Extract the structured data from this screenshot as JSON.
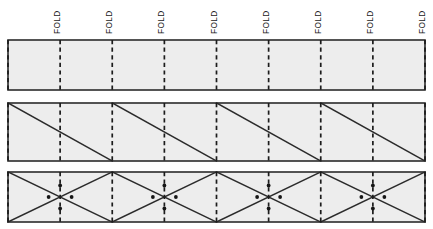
{
  "figure": {
    "canvas": {
      "width": 433,
      "height": 229
    },
    "background_color": "#ffffff",
    "panel_fill_color": "#ededed",
    "line_color": "#2b2b2b",
    "fold_line_color": "#1c1c1c",
    "dot_color": "#161616"
  },
  "fold_labels": [
    {
      "text": "FOLD"
    },
    {
      "text": "FOLD"
    },
    {
      "text": "FOLD"
    },
    {
      "text": "FOLD"
    },
    {
      "text": "FOLD"
    },
    {
      "text": "FOLD"
    },
    {
      "text": "FOLD"
    },
    {
      "text": "FOLD"
    }
  ],
  "geometry": {
    "left": 8,
    "right": 425,
    "cell_count": 8,
    "cell_width": 52.125,
    "fold_positions": [
      8,
      60.125,
      112.25,
      164.375,
      216.5,
      268.625,
      320.75,
      372.875,
      425
    ],
    "label_positions": [
      60.125,
      112.25,
      164.375,
      216.5,
      268.625,
      320.75,
      372.875,
      425
    ],
    "label_baseline_y": 34
  },
  "panels": [
    {
      "name": "plain-strip",
      "label": "Panel 1 - plain strip with fold lines",
      "top": 40,
      "bottom": 90,
      "pattern": "none",
      "has_dots": false
    },
    {
      "name": "sawtooth-strip",
      "label": "Panel 2 - sawtooth diagonals",
      "top": 103,
      "bottom": 161,
      "pattern": "sawtooth",
      "has_dots": false,
      "diagonals": [
        {
          "x1": 8,
          "y1": 103,
          "x2": 112.25,
          "y2": 161
        },
        {
          "x1": 112.25,
          "y1": 103,
          "x2": 216.5,
          "y2": 161
        },
        {
          "x1": 216.5,
          "y1": 103,
          "x2": 320.75,
          "y2": 161
        },
        {
          "x1": 320.75,
          "y1": 103,
          "x2": 425,
          "y2": 161
        }
      ]
    },
    {
      "name": "zigzag-strip",
      "label": "Panel 3 - crossed zigzag diagonals with vertex dots",
      "top": 172,
      "bottom": 222,
      "pattern": "crossed-zigzag",
      "has_dots": true,
      "diagonals": [
        {
          "x1": 8,
          "y1": 172,
          "x2": 112.25,
          "y2": 222
        },
        {
          "x1": 112.25,
          "y1": 172,
          "x2": 216.5,
          "y2": 222
        },
        {
          "x1": 216.5,
          "y1": 172,
          "x2": 320.75,
          "y2": 222
        },
        {
          "x1": 320.75,
          "y1": 172,
          "x2": 425,
          "y2": 222
        },
        {
          "x1": 8,
          "y1": 222,
          "x2": 112.25,
          "y2": 172
        },
        {
          "x1": 112.25,
          "y1": 222,
          "x2": 216.5,
          "y2": 172
        },
        {
          "x1": 216.5,
          "y1": 222,
          "x2": 320.75,
          "y2": 172
        },
        {
          "x1": 320.75,
          "y1": 222,
          "x2": 425,
          "y2": 172
        }
      ],
      "dot_clusters": [
        {
          "cx": 60.125,
          "cy": 197
        },
        {
          "cx": 164.375,
          "cy": 197
        },
        {
          "cx": 268.625,
          "cy": 197
        },
        {
          "cx": 372.875,
          "cy": 197
        }
      ],
      "dot_offsets": [
        {
          "dx": 0,
          "dy": -11.5
        },
        {
          "dx": 0,
          "dy": 11.5
        },
        {
          "dx": -11.5,
          "dy": 0
        },
        {
          "dx": 11.5,
          "dy": 0
        }
      ],
      "dot_radius": 1.9
    }
  ]
}
